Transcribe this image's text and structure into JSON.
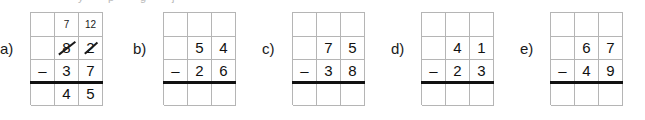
{
  "worksheet": {
    "type": "two-digit-subtraction-with-regrouping",
    "top_artifact_marks": [
      "y",
      "p",
      "g",
      "j"
    ],
    "layout": {
      "columns": 3,
      "rows": 4,
      "row_names": [
        "regroup",
        "minuend",
        "subtrahend",
        "difference"
      ]
    },
    "problems": [
      {
        "label": "a)",
        "left": 0,
        "grid_left": 30,
        "solved": true,
        "rows": [
          {
            "name": "regroup",
            "cells": [
              {
                "text": "",
                "small": false,
                "struck": false
              },
              {
                "text": "7",
                "small": true,
                "struck": false
              },
              {
                "text": "12",
                "small": true,
                "struck": false
              }
            ]
          },
          {
            "name": "minuend",
            "cells": [
              {
                "text": "",
                "small": false,
                "struck": false
              },
              {
                "text": "8",
                "small": false,
                "struck": true
              },
              {
                "text": "2",
                "small": false,
                "struck": true
              }
            ]
          },
          {
            "name": "subtrahend",
            "cells": [
              {
                "text": "–",
                "small": false,
                "struck": false
              },
              {
                "text": "3",
                "small": false,
                "struck": false
              },
              {
                "text": "7",
                "small": false,
                "struck": false
              }
            ]
          },
          {
            "name": "difference",
            "cells": [
              {
                "text": "",
                "small": false,
                "struck": false
              },
              {
                "text": "4",
                "small": false,
                "struck": false
              },
              {
                "text": "5",
                "small": false,
                "struck": false
              }
            ]
          }
        ]
      },
      {
        "label": "b)",
        "left": 133,
        "grid_left": 163,
        "solved": false,
        "rows": [
          {
            "name": "regroup",
            "cells": [
              {
                "text": "",
                "small": true,
                "struck": false
              },
              {
                "text": "",
                "small": true,
                "struck": false
              },
              {
                "text": "",
                "small": true,
                "struck": false
              }
            ]
          },
          {
            "name": "minuend",
            "cells": [
              {
                "text": "",
                "small": false,
                "struck": false
              },
              {
                "text": "5",
                "small": false,
                "struck": false
              },
              {
                "text": "4",
                "small": false,
                "struck": false
              }
            ]
          },
          {
            "name": "subtrahend",
            "cells": [
              {
                "text": "–",
                "small": false,
                "struck": false
              },
              {
                "text": "2",
                "small": false,
                "struck": false
              },
              {
                "text": "6",
                "small": false,
                "struck": false
              }
            ]
          },
          {
            "name": "difference",
            "cells": [
              {
                "text": "",
                "small": false,
                "struck": false
              },
              {
                "text": "",
                "small": false,
                "struck": false
              },
              {
                "text": "",
                "small": false,
                "struck": false
              }
            ]
          }
        ]
      },
      {
        "label": "c)",
        "left": 262,
        "grid_left": 292,
        "solved": false,
        "rows": [
          {
            "name": "regroup",
            "cells": [
              {
                "text": "",
                "small": true,
                "struck": false
              },
              {
                "text": "",
                "small": true,
                "struck": false
              },
              {
                "text": "",
                "small": true,
                "struck": false
              }
            ]
          },
          {
            "name": "minuend",
            "cells": [
              {
                "text": "",
                "small": false,
                "struck": false
              },
              {
                "text": "7",
                "small": false,
                "struck": false
              },
              {
                "text": "5",
                "small": false,
                "struck": false
              }
            ]
          },
          {
            "name": "subtrahend",
            "cells": [
              {
                "text": "–",
                "small": false,
                "struck": false
              },
              {
                "text": "3",
                "small": false,
                "struck": false
              },
              {
                "text": "8",
                "small": false,
                "struck": false
              }
            ]
          },
          {
            "name": "difference",
            "cells": [
              {
                "text": "",
                "small": false,
                "struck": false
              },
              {
                "text": "",
                "small": false,
                "struck": false
              },
              {
                "text": "",
                "small": false,
                "struck": false
              }
            ]
          }
        ]
      },
      {
        "label": "d)",
        "left": 391,
        "grid_left": 421,
        "solved": false,
        "rows": [
          {
            "name": "regroup",
            "cells": [
              {
                "text": "",
                "small": true,
                "struck": false
              },
              {
                "text": "",
                "small": true,
                "struck": false
              },
              {
                "text": "",
                "small": true,
                "struck": false
              }
            ]
          },
          {
            "name": "minuend",
            "cells": [
              {
                "text": "",
                "small": false,
                "struck": false
              },
              {
                "text": "4",
                "small": false,
                "struck": false
              },
              {
                "text": "1",
                "small": false,
                "struck": false
              }
            ]
          },
          {
            "name": "subtrahend",
            "cells": [
              {
                "text": "–",
                "small": false,
                "struck": false
              },
              {
                "text": "2",
                "small": false,
                "struck": false
              },
              {
                "text": "3",
                "small": false,
                "struck": false
              }
            ]
          },
          {
            "name": "difference",
            "cells": [
              {
                "text": "",
                "small": false,
                "struck": false
              },
              {
                "text": "",
                "small": false,
                "struck": false
              },
              {
                "text": "",
                "small": false,
                "struck": false
              }
            ]
          }
        ]
      },
      {
        "label": "e)",
        "left": 520,
        "grid_left": 550,
        "solved": false,
        "rows": [
          {
            "name": "regroup",
            "cells": [
              {
                "text": "",
                "small": true,
                "struck": false
              },
              {
                "text": "",
                "small": true,
                "struck": false
              },
              {
                "text": "",
                "small": true,
                "struck": false
              }
            ]
          },
          {
            "name": "minuend",
            "cells": [
              {
                "text": "",
                "small": false,
                "struck": false
              },
              {
                "text": "6",
                "small": false,
                "struck": false
              },
              {
                "text": "7",
                "small": false,
                "struck": false
              }
            ]
          },
          {
            "name": "subtrahend",
            "cells": [
              {
                "text": "–",
                "small": false,
                "struck": false
              },
              {
                "text": "4",
                "small": false,
                "struck": false
              },
              {
                "text": "9",
                "small": false,
                "struck": false
              }
            ]
          },
          {
            "name": "difference",
            "cells": [
              {
                "text": "",
                "small": false,
                "struck": false
              },
              {
                "text": "",
                "small": false,
                "struck": false
              },
              {
                "text": "",
                "small": false,
                "struck": false
              }
            ]
          }
        ]
      }
    ]
  }
}
